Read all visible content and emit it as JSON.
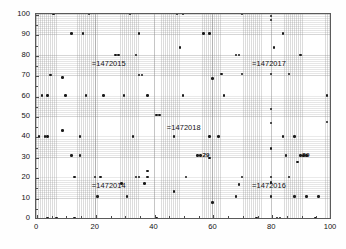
{
  "figure": {
    "title": "",
    "background_color": "#fefefe",
    "plot_background_color": "#ffffff",
    "axis_color": "#5a5a5a",
    "marker_color": "#1a1a1a",
    "grid": "fine dotted minor grid with major vertical gridlines"
  },
  "axes": {
    "x": {
      "label": "",
      "min": 0,
      "max": 100,
      "major_ticks": [
        0,
        20,
        40,
        60,
        80,
        100
      ],
      "tick_labels": [
        "0",
        "20",
        "40",
        "60",
        "80",
        "100"
      ],
      "minor_tick_step": 5
    },
    "y": {
      "label": "",
      "min": 0,
      "max": 100,
      "major_ticks": [
        0,
        10,
        20,
        30,
        40,
        50,
        60,
        70,
        80,
        90,
        100
      ],
      "tick_labels": [
        "0",
        "10",
        "20",
        "30",
        "40",
        "50",
        "60",
        "70",
        "80",
        "90",
        "100"
      ],
      "minor_tick_step": 5
    }
  },
  "annotations": [
    {
      "id": "annot-1472015",
      "text": "=1472015",
      "x": 19.0,
      "y": 75.5,
      "size": "normal"
    },
    {
      "id": "annot-1472017",
      "text": "=1472017",
      "x": 73.5,
      "y": 75.5,
      "size": "normal"
    },
    {
      "id": "annot-1472018",
      "text": "=1472018",
      "x": 44.5,
      "y": 44.0,
      "size": "normal"
    },
    {
      "id": "annot-1472014",
      "text": "=1472014",
      "x": 19.0,
      "y": 15.5,
      "size": "normal"
    },
    {
      "id": "annot-1472016",
      "text": "=1472016",
      "x": 73.5,
      "y": 15.5,
      "size": "normal"
    },
    {
      "id": "annot-29-mid",
      "text": "29",
      "x": 56.6,
      "y": 31.2,
      "size": "small"
    },
    {
      "id": "annot-29-right",
      "text": "29",
      "x": 90.6,
      "y": 31.2,
      "size": "small"
    }
  ],
  "chart_data": {
    "type": "scatter",
    "title": "",
    "xlabel": "",
    "ylabel": "",
    "xlim": [
      0,
      100
    ],
    "ylim": [
      0,
      100
    ],
    "grid": true,
    "legend": "none",
    "marker": "dot",
    "marker_color": "#1a1a1a",
    "series": [
      {
        "name": "points",
        "points": [
          [
            6,
            100
          ],
          [
            18,
            100
          ],
          [
            32,
            100
          ],
          [
            48,
            100
          ],
          [
            50,
            100
          ],
          [
            70,
            100
          ],
          [
            80,
            99
          ],
          [
            80,
            97
          ],
          [
            12,
            90.5
          ],
          [
            16,
            90.5
          ],
          [
            35,
            90.5
          ],
          [
            57,
            90.5
          ],
          [
            59,
            90.5
          ],
          [
            84,
            90.5
          ],
          [
            49,
            83.5
          ],
          [
            81,
            83.5
          ],
          [
            27,
            80
          ],
          [
            28,
            80
          ],
          [
            34,
            80
          ],
          [
            68,
            80
          ],
          [
            69,
            80
          ],
          [
            90,
            80
          ],
          [
            5,
            70
          ],
          [
            9,
            69
          ],
          [
            35,
            70
          ],
          [
            36,
            70
          ],
          [
            63,
            70.5
          ],
          [
            70,
            70.5
          ],
          [
            80,
            70.5
          ],
          [
            86,
            70.5
          ],
          [
            60,
            68.5
          ],
          [
            2,
            60
          ],
          [
            4,
            60
          ],
          [
            10,
            60
          ],
          [
            17,
            60
          ],
          [
            23,
            60
          ],
          [
            30,
            60
          ],
          [
            38,
            60
          ],
          [
            50,
            60
          ],
          [
            64,
            60
          ],
          [
            99,
            60
          ],
          [
            80,
            53.5
          ],
          [
            41,
            50.5
          ],
          [
            42,
            50.5
          ],
          [
            99,
            47
          ],
          [
            80,
            46.5
          ],
          [
            9,
            43
          ],
          [
            1,
            40
          ],
          [
            3,
            40
          ],
          [
            4,
            40
          ],
          [
            15,
            40
          ],
          [
            33,
            40
          ],
          [
            47,
            40
          ],
          [
            59,
            40
          ],
          [
            62,
            40
          ],
          [
            84,
            40
          ],
          [
            88,
            40
          ],
          [
            80,
            34
          ],
          [
            12,
            30.5
          ],
          [
            15,
            30.5
          ],
          [
            55,
            30.5
          ],
          [
            56,
            30.5
          ],
          [
            59,
            29.5
          ],
          [
            85,
            30.5
          ],
          [
            90,
            30.5
          ],
          [
            91,
            30.5
          ],
          [
            92,
            30.5
          ],
          [
            89,
            27.5
          ],
          [
            38,
            23
          ],
          [
            13,
            20
          ],
          [
            20,
            20
          ],
          [
            22,
            20
          ],
          [
            34,
            20
          ],
          [
            35,
            20
          ],
          [
            38,
            20
          ],
          [
            51,
            20
          ],
          [
            70,
            20
          ],
          [
            80,
            20
          ],
          [
            86,
            20
          ],
          [
            80,
            17.5
          ],
          [
            37,
            17
          ],
          [
            29,
            17
          ],
          [
            69,
            16.5
          ],
          [
            21,
            10.5
          ],
          [
            31,
            10.5
          ],
          [
            47,
            13
          ],
          [
            68,
            10.5
          ],
          [
            80,
            10.5
          ],
          [
            88,
            10.5
          ],
          [
            92,
            10.5
          ],
          [
            96,
            10.5
          ],
          [
            60,
            7.5
          ],
          [
            4,
            0
          ],
          [
            7,
            0
          ],
          [
            13,
            0
          ],
          [
            41,
            0
          ],
          [
            75,
            0
          ],
          [
            82,
            0
          ],
          [
            83,
            0
          ],
          [
            95,
            0
          ]
        ]
      }
    ]
  }
}
